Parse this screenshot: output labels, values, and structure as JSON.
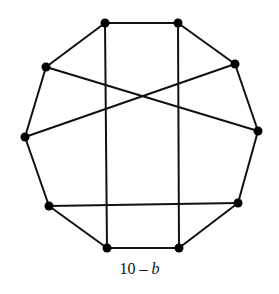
{
  "figure": {
    "caption_number": "10",
    "caption_dash": " – ",
    "caption_letter": "b",
    "caption_full": "10 – b"
  },
  "graph": {
    "description": "Decagon graph: 10 vertices on outer cycle plus 3 chords (two vertical, one pair of crossing diagonals, one near-horizontal)",
    "vertices": [
      {
        "id": "v1",
        "x": 105,
        "y": 23
      },
      {
        "id": "v2",
        "x": 178,
        "y": 23
      },
      {
        "id": "v3",
        "x": 235,
        "y": 64
      },
      {
        "id": "v4",
        "x": 258,
        "y": 131
      },
      {
        "id": "v5",
        "x": 238,
        "y": 203
      },
      {
        "id": "v6",
        "x": 179,
        "y": 248
      },
      {
        "id": "v7",
        "x": 107,
        "y": 248
      },
      {
        "id": "v8",
        "x": 49,
        "y": 206
      },
      {
        "id": "v9",
        "x": 25,
        "y": 137
      },
      {
        "id": "v10",
        "x": 46,
        "y": 67
      }
    ],
    "edges": [
      {
        "from": "v1",
        "to": "v2",
        "kind": "cycle"
      },
      {
        "from": "v2",
        "to": "v3",
        "kind": "cycle"
      },
      {
        "from": "v3",
        "to": "v4",
        "kind": "cycle"
      },
      {
        "from": "v4",
        "to": "v5",
        "kind": "cycle"
      },
      {
        "from": "v5",
        "to": "v6",
        "kind": "cycle"
      },
      {
        "from": "v6",
        "to": "v7",
        "kind": "cycle"
      },
      {
        "from": "v7",
        "to": "v8",
        "kind": "cycle"
      },
      {
        "from": "v8",
        "to": "v9",
        "kind": "cycle"
      },
      {
        "from": "v9",
        "to": "v10",
        "kind": "cycle"
      },
      {
        "from": "v10",
        "to": "v1",
        "kind": "cycle"
      },
      {
        "from": "v1",
        "to": "v7",
        "kind": "chord"
      },
      {
        "from": "v2",
        "to": "v6",
        "kind": "chord"
      },
      {
        "from": "v10",
        "to": "v4",
        "kind": "chord"
      },
      {
        "from": "v3",
        "to": "v9",
        "kind": "chord"
      },
      {
        "from": "v8",
        "to": "v5",
        "kind": "chord"
      }
    ],
    "colors": {
      "edge": "#111111",
      "vertex": "#000000",
      "background": "#ffffff"
    },
    "vertex_radius": 4.5
  }
}
